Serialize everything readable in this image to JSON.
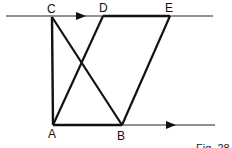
{
  "diagram": {
    "points": {
      "A": {
        "label": "A",
        "x": 53,
        "y": 125
      },
      "B": {
        "label": "B",
        "x": 122,
        "y": 125
      },
      "C": {
        "label": "C",
        "x": 52,
        "y": 17
      },
      "D": {
        "label": "D",
        "x": 103,
        "y": 16
      },
      "E": {
        "label": "E",
        "x": 170,
        "y": 16
      }
    },
    "caption": "Fig. 28",
    "colors": {
      "stroke": "#111111",
      "background": "#ffffff"
    }
  }
}
